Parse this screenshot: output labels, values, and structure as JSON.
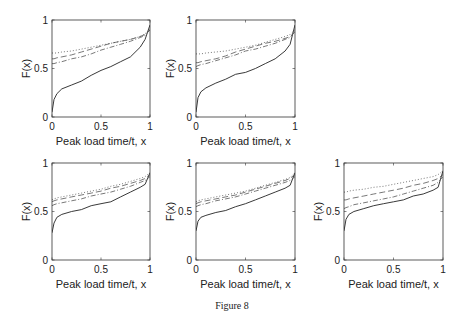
{
  "caption": "Figure 8",
  "chart_data": [
    {
      "type": "line",
      "panel": "top-left",
      "title": "",
      "xlabel": "Peak load time/t, x",
      "ylabel": "F(x)",
      "xlim": [
        0,
        1
      ],
      "ylim": [
        0,
        1
      ],
      "xticks": [
        "0",
        "0.5",
        "1"
      ],
      "yticks": [
        "0",
        "0.5",
        "1"
      ],
      "x": [
        0,
        0.02,
        0.05,
        0.1,
        0.2,
        0.3,
        0.4,
        0.5,
        0.6,
        0.7,
        0.8,
        0.9,
        0.95,
        1
      ],
      "series": [
        {
          "name": "solid",
          "style": "solid",
          "values": [
            0.05,
            0.18,
            0.24,
            0.29,
            0.33,
            0.37,
            0.43,
            0.48,
            0.52,
            0.57,
            0.62,
            0.72,
            0.8,
            0.95
          ]
        },
        {
          "name": "dash-dot",
          "style": "dashdot",
          "values": [
            0.55,
            0.55,
            0.56,
            0.57,
            0.6,
            0.62,
            0.65,
            0.69,
            0.72,
            0.75,
            0.78,
            0.82,
            0.84,
            0.9
          ]
        },
        {
          "name": "dashed",
          "style": "dashed",
          "values": [
            0.6,
            0.6,
            0.61,
            0.62,
            0.64,
            0.67,
            0.7,
            0.73,
            0.76,
            0.78,
            0.8,
            0.83,
            0.85,
            0.9
          ]
        },
        {
          "name": "dotted",
          "style": "dotted",
          "values": [
            0.66,
            0.66,
            0.66,
            0.67,
            0.68,
            0.7,
            0.72,
            0.74,
            0.76,
            0.78,
            0.8,
            0.83,
            0.86,
            0.9
          ]
        }
      ]
    },
    {
      "type": "line",
      "panel": "top-middle",
      "title": "",
      "xlabel": "Peak load time/t, x",
      "ylabel": "F(x)",
      "xlim": [
        0,
        1
      ],
      "ylim": [
        0,
        1
      ],
      "xticks": [
        "0",
        "0.5",
        "1"
      ],
      "yticks": [
        "0",
        "0.5",
        "1"
      ],
      "x": [
        0,
        0.02,
        0.05,
        0.1,
        0.2,
        0.3,
        0.4,
        0.5,
        0.6,
        0.7,
        0.8,
        0.9,
        0.95,
        1
      ],
      "series": [
        {
          "name": "solid",
          "style": "solid",
          "values": [
            0.05,
            0.2,
            0.26,
            0.3,
            0.35,
            0.39,
            0.44,
            0.46,
            0.5,
            0.55,
            0.6,
            0.68,
            0.75,
            0.95
          ]
        },
        {
          "name": "dash-dot",
          "style": "dashdot",
          "values": [
            0.52,
            0.53,
            0.54,
            0.55,
            0.58,
            0.61,
            0.64,
            0.68,
            0.7,
            0.73,
            0.76,
            0.8,
            0.82,
            0.88
          ]
        },
        {
          "name": "dashed",
          "style": "dashed",
          "values": [
            0.56,
            0.56,
            0.57,
            0.58,
            0.6,
            0.63,
            0.67,
            0.7,
            0.73,
            0.76,
            0.78,
            0.81,
            0.83,
            0.88
          ]
        },
        {
          "name": "dotted",
          "style": "dotted",
          "values": [
            0.65,
            0.65,
            0.65,
            0.66,
            0.67,
            0.68,
            0.7,
            0.72,
            0.74,
            0.77,
            0.8,
            0.83,
            0.85,
            0.9
          ]
        }
      ]
    },
    {
      "type": "line",
      "panel": "bottom-left",
      "title": "",
      "xlabel": "Peak load time/t, x",
      "ylabel": "F(x)",
      "xlim": [
        0,
        1
      ],
      "ylim": [
        0,
        1
      ],
      "xticks": [
        "0",
        "0.5",
        "1"
      ],
      "yticks": [
        "0",
        "0.5",
        "1"
      ],
      "x": [
        0,
        0.02,
        0.05,
        0.1,
        0.2,
        0.3,
        0.4,
        0.5,
        0.6,
        0.7,
        0.8,
        0.9,
        0.95,
        1
      ],
      "series": [
        {
          "name": "solid",
          "style": "solid",
          "values": [
            0.28,
            0.38,
            0.44,
            0.47,
            0.5,
            0.52,
            0.56,
            0.58,
            0.6,
            0.65,
            0.7,
            0.75,
            0.78,
            0.9
          ]
        },
        {
          "name": "dash-dot",
          "style": "dashdot",
          "values": [
            0.56,
            0.57,
            0.58,
            0.59,
            0.61,
            0.63,
            0.66,
            0.68,
            0.7,
            0.73,
            0.76,
            0.8,
            0.82,
            0.86
          ]
        },
        {
          "name": "dashed",
          "style": "dashed",
          "values": [
            0.6,
            0.61,
            0.62,
            0.63,
            0.65,
            0.67,
            0.69,
            0.71,
            0.74,
            0.76,
            0.79,
            0.82,
            0.84,
            0.88
          ]
        },
        {
          "name": "dotted",
          "style": "dotted",
          "values": [
            0.62,
            0.63,
            0.64,
            0.65,
            0.67,
            0.69,
            0.71,
            0.73,
            0.76,
            0.78,
            0.81,
            0.84,
            0.86,
            0.9
          ]
        }
      ]
    },
    {
      "type": "line",
      "panel": "bottom-middle",
      "title": "",
      "xlabel": "Peak load time/t, x",
      "ylabel": "F(x)",
      "xlim": [
        0,
        1
      ],
      "ylim": [
        0,
        1
      ],
      "xticks": [
        "0",
        "0.5",
        "1"
      ],
      "yticks": [
        "0",
        "0.5",
        "1"
      ],
      "x": [
        0,
        0.02,
        0.05,
        0.1,
        0.2,
        0.3,
        0.4,
        0.5,
        0.6,
        0.7,
        0.8,
        0.9,
        0.95,
        1
      ],
      "series": [
        {
          "name": "solid",
          "style": "solid",
          "values": [
            0.3,
            0.4,
            0.44,
            0.46,
            0.49,
            0.51,
            0.55,
            0.58,
            0.62,
            0.66,
            0.7,
            0.74,
            0.77,
            0.9
          ]
        },
        {
          "name": "dash-dot",
          "style": "dashdot",
          "values": [
            0.55,
            0.56,
            0.57,
            0.58,
            0.61,
            0.63,
            0.65,
            0.68,
            0.71,
            0.74,
            0.77,
            0.8,
            0.82,
            0.86
          ]
        },
        {
          "name": "dashed",
          "style": "dashed",
          "values": [
            0.58,
            0.59,
            0.6,
            0.61,
            0.63,
            0.65,
            0.67,
            0.7,
            0.73,
            0.76,
            0.79,
            0.82,
            0.84,
            0.88
          ]
        },
        {
          "name": "dotted",
          "style": "dotted",
          "values": [
            0.6,
            0.61,
            0.62,
            0.63,
            0.65,
            0.67,
            0.69,
            0.71,
            0.74,
            0.77,
            0.8,
            0.83,
            0.85,
            0.9
          ]
        }
      ]
    },
    {
      "type": "line",
      "panel": "bottom-right",
      "title": "",
      "xlabel": "Peak load time/t, x",
      "ylabel": "F(x)",
      "xlim": [
        0,
        1
      ],
      "ylim": [
        0,
        1
      ],
      "xticks": [
        "0",
        "0.5",
        "1"
      ],
      "yticks": [
        "0",
        "0.5",
        "1"
      ],
      "x": [
        0,
        0.02,
        0.05,
        0.1,
        0.2,
        0.3,
        0.4,
        0.5,
        0.6,
        0.7,
        0.8,
        0.9,
        0.95,
        1
      ],
      "series": [
        {
          "name": "solid",
          "style": "solid",
          "values": [
            0.3,
            0.42,
            0.47,
            0.5,
            0.53,
            0.56,
            0.58,
            0.6,
            0.62,
            0.66,
            0.68,
            0.72,
            0.75,
            0.92
          ]
        },
        {
          "name": "dash-dot",
          "style": "dashdot",
          "values": [
            0.53,
            0.54,
            0.55,
            0.57,
            0.59,
            0.61,
            0.63,
            0.65,
            0.68,
            0.71,
            0.74,
            0.77,
            0.8,
            0.86
          ]
        },
        {
          "name": "dashed",
          "style": "dashed",
          "values": [
            0.62,
            0.62,
            0.63,
            0.64,
            0.66,
            0.68,
            0.7,
            0.72,
            0.74,
            0.77,
            0.79,
            0.82,
            0.84,
            0.88
          ]
        },
        {
          "name": "dotted",
          "style": "dotted",
          "values": [
            0.7,
            0.7,
            0.71,
            0.72,
            0.73,
            0.75,
            0.76,
            0.78,
            0.8,
            0.82,
            0.84,
            0.86,
            0.88,
            0.92
          ]
        }
      ]
    }
  ],
  "layout": {
    "panels": [
      {
        "left": 52,
        "top": 20,
        "width": 98,
        "height": 97
      },
      {
        "left": 196,
        "top": 20,
        "width": 99,
        "height": 97
      },
      {
        "left": 52,
        "top": 163,
        "width": 98,
        "height": 97
      },
      {
        "left": 196,
        "top": 163,
        "width": 99,
        "height": 97
      },
      {
        "left": 344,
        "top": 163,
        "width": 99,
        "height": 97
      }
    ],
    "line_color": "#222222",
    "axis_color": "#333333"
  }
}
